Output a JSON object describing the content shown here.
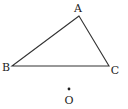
{
  "diagram": {
    "type": "geometry",
    "stroke_color": "#333333",
    "label_color": "#222222",
    "points": {
      "A": {
        "label": "A",
        "x": 79,
        "y": 16,
        "label_x": 78,
        "label_y": 8
      },
      "B": {
        "label": "B",
        "x": 12,
        "y": 66,
        "label_x": 6,
        "label_y": 67
      },
      "C": {
        "label": "C",
        "x": 109,
        "y": 66,
        "label_x": 115,
        "label_y": 70
      },
      "O": {
        "label": "O",
        "x": 69,
        "y": 89,
        "label_x": 69,
        "label_y": 100
      }
    },
    "segments": [
      {
        "from": "A",
        "to": "B"
      },
      {
        "from": "B",
        "to": "C"
      },
      {
        "from": "C",
        "to": "A"
      }
    ]
  }
}
